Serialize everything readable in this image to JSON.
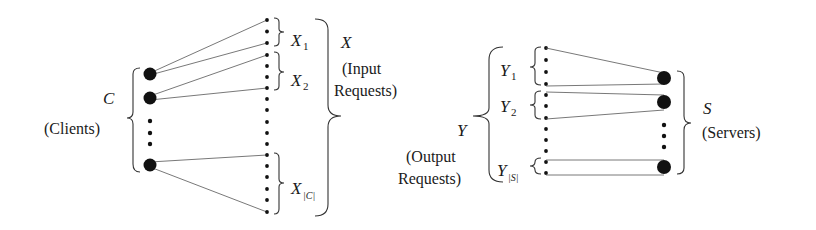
{
  "clients": {
    "symbol": "C",
    "label": "(Clients)"
  },
  "input_requests": {
    "symbol": "X",
    "label_line1": "(Input",
    "label_line2": "Requests)",
    "subsets": [
      {
        "base": "X",
        "sub": "1"
      },
      {
        "base": "X",
        "sub": "2"
      },
      {
        "base": "X",
        "sub": "|C|"
      }
    ]
  },
  "output_requests": {
    "symbol": "Y",
    "label_line1": "(Output",
    "label_line2": "Requests)",
    "subsets": [
      {
        "base": "Y",
        "sub": "1"
      },
      {
        "base": "Y",
        "sub": "2"
      },
      {
        "base": "Y",
        "sub": "|S|"
      }
    ]
  },
  "servers": {
    "symbol": "S",
    "label": "(Servers)"
  },
  "colors": {
    "ink": "#111111",
    "line": "#555555",
    "background": "#ffffff"
  }
}
